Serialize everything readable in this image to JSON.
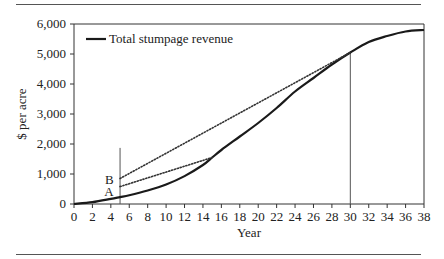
{
  "chart_data": {
    "type": "line",
    "title": "",
    "xlabel": "Year",
    "ylabel": "$ per acre",
    "xlim": [
      0,
      38
    ],
    "ylim": [
      0,
      6000
    ],
    "grid": false,
    "legend_position": "top-left (inside plot)",
    "x_ticks": [
      0,
      2,
      4,
      6,
      8,
      10,
      12,
      14,
      16,
      18,
      20,
      22,
      24,
      26,
      28,
      30,
      32,
      34,
      36,
      38
    ],
    "y_ticks": [
      0,
      1000,
      2000,
      3000,
      4000,
      5000,
      6000
    ],
    "y_tick_labels": [
      "0",
      "1,000",
      "2,000",
      "3,000",
      "4,000",
      "5,000",
      "6,000"
    ],
    "series": [
      {
        "name": "Total stumpage revenue",
        "style": "solid",
        "x": [
          0,
          2,
          4,
          5,
          6,
          8,
          10,
          12,
          14,
          15,
          16,
          18,
          20,
          22,
          24,
          26,
          28,
          30,
          32,
          34,
          36,
          38
        ],
        "values": [
          0,
          60,
          170,
          230,
          290,
          450,
          650,
          930,
          1300,
          1550,
          1800,
          2250,
          2700,
          3200,
          3750,
          4200,
          4650,
          5050,
          5400,
          5600,
          5750,
          5800
        ]
      },
      {
        "name": "Chord B (year 5 to year 30)",
        "style": "dotted",
        "x": [
          5,
          30
        ],
        "values": [
          850,
          5050
        ]
      },
      {
        "name": "Chord A (year 5 to year 15)",
        "style": "dotted",
        "x": [
          5,
          15
        ],
        "values": [
          580,
          1550
        ]
      }
    ],
    "reference_lines": [
      {
        "orientation": "vertical",
        "x": 5,
        "y_from": 0,
        "y_to": 1870
      },
      {
        "orientation": "vertical",
        "x": 30,
        "y_from": 0,
        "y_to": 5050
      }
    ],
    "annotations": [
      {
        "text": "B",
        "x": 4.3,
        "y": 850
      },
      {
        "text": "A",
        "x": 4.3,
        "y": 450
      }
    ]
  }
}
